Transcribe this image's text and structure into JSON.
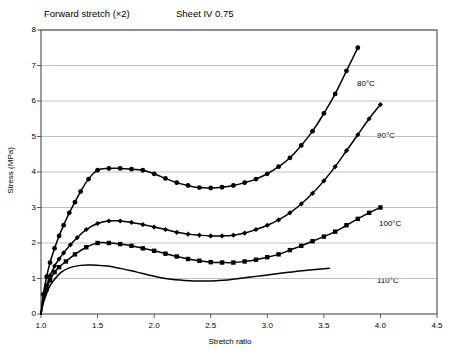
{
  "titles": {
    "forward": "Forward stretch (×2)",
    "sheet": "Sheet IV 0.75"
  },
  "axes": {
    "x_label": "Stretch ratio",
    "y_label": "Stress (MPa)"
  },
  "series_labels": {
    "c80": "80°C",
    "c90": "90°C",
    "c100": "100°C",
    "c110": "110°C"
  },
  "chart_data": {
    "type": "line",
    "subtitle": "Sheet IV 0.75",
    "xlabel": "Stretch ratio",
    "ylabel": "Stress (MPa)",
    "xlim": [
      1.0,
      4.5
    ],
    "ylim": [
      0,
      8
    ],
    "xticks": [
      1.0,
      1.5,
      2.0,
      2.5,
      3.0,
      3.5,
      4.0,
      4.5
    ],
    "xtick_labels": [
      "1.0",
      "1.5",
      "2.0",
      "2.5",
      "3.0",
      "3.5",
      "4.0",
      "4.5"
    ],
    "yticks": [
      0,
      1,
      2,
      3,
      4,
      5,
      6,
      7,
      8
    ],
    "ytick_labels": [
      "0",
      "1",
      "2",
      "3",
      "4",
      "5",
      "6",
      "7",
      "8"
    ],
    "grid": "horizontal",
    "legend": "inline-annotations",
    "line_color": "#000000",
    "series": [
      {
        "name": "80°C",
        "marker": "circle",
        "x": [
          1.0,
          1.02,
          1.05,
          1.08,
          1.12,
          1.16,
          1.2,
          1.25,
          1.3,
          1.35,
          1.42,
          1.5,
          1.6,
          1.7,
          1.8,
          1.9,
          2.0,
          2.1,
          2.2,
          2.3,
          2.4,
          2.5,
          2.6,
          2.7,
          2.8,
          2.9,
          3.0,
          3.1,
          3.2,
          3.3,
          3.4,
          3.5,
          3.6,
          3.7,
          3.8
        ],
        "y": [
          0.0,
          0.55,
          1.05,
          1.45,
          1.85,
          2.2,
          2.5,
          2.85,
          3.15,
          3.45,
          3.8,
          4.05,
          4.1,
          4.1,
          4.08,
          4.05,
          3.95,
          3.82,
          3.7,
          3.62,
          3.56,
          3.55,
          3.57,
          3.62,
          3.7,
          3.8,
          3.95,
          4.15,
          4.4,
          4.75,
          5.15,
          5.65,
          6.2,
          6.85,
          7.5
        ]
      },
      {
        "name": "90°C",
        "marker": "diamond",
        "x": [
          1.0,
          1.02,
          1.05,
          1.08,
          1.12,
          1.16,
          1.2,
          1.26,
          1.32,
          1.4,
          1.5,
          1.6,
          1.7,
          1.8,
          1.9,
          2.0,
          2.1,
          2.2,
          2.3,
          2.4,
          2.5,
          2.6,
          2.7,
          2.8,
          2.9,
          3.0,
          3.1,
          3.2,
          3.3,
          3.4,
          3.5,
          3.6,
          3.7,
          3.8,
          3.9,
          4.0
        ],
        "y": [
          0.0,
          0.42,
          0.8,
          1.08,
          1.35,
          1.55,
          1.72,
          1.95,
          2.15,
          2.38,
          2.55,
          2.62,
          2.62,
          2.58,
          2.52,
          2.45,
          2.38,
          2.3,
          2.25,
          2.22,
          2.2,
          2.2,
          2.22,
          2.28,
          2.38,
          2.5,
          2.65,
          2.85,
          3.1,
          3.4,
          3.75,
          4.15,
          4.6,
          5.05,
          5.5,
          5.9
        ]
      },
      {
        "name": "100°C",
        "marker": "square",
        "x": [
          1.0,
          1.02,
          1.05,
          1.08,
          1.12,
          1.16,
          1.22,
          1.3,
          1.4,
          1.5,
          1.6,
          1.7,
          1.8,
          1.9,
          2.0,
          2.1,
          2.2,
          2.3,
          2.4,
          2.5,
          2.6,
          2.7,
          2.8,
          2.9,
          3.0,
          3.1,
          3.2,
          3.3,
          3.4,
          3.5,
          3.6,
          3.7,
          3.8,
          3.9,
          4.0
        ],
        "y": [
          0.0,
          0.38,
          0.7,
          0.95,
          1.18,
          1.32,
          1.48,
          1.68,
          1.88,
          2.0,
          2.0,
          1.97,
          1.92,
          1.85,
          1.78,
          1.7,
          1.62,
          1.55,
          1.5,
          1.46,
          1.45,
          1.45,
          1.48,
          1.53,
          1.6,
          1.68,
          1.8,
          1.92,
          2.05,
          2.18,
          2.32,
          2.5,
          2.68,
          2.85,
          3.0
        ]
      },
      {
        "name": "110°C",
        "marker": "none",
        "x": [
          1.0,
          1.02,
          1.05,
          1.08,
          1.12,
          1.18,
          1.25,
          1.35,
          1.45,
          1.55,
          1.65,
          1.75,
          1.85,
          1.95,
          2.05,
          2.15,
          2.25,
          2.35,
          2.45,
          2.55,
          2.65,
          2.75,
          2.85,
          2.95,
          3.05,
          3.15,
          3.25,
          3.35,
          3.45,
          3.55
        ],
        "y": [
          0.0,
          0.3,
          0.58,
          0.8,
          0.98,
          1.18,
          1.3,
          1.37,
          1.38,
          1.36,
          1.32,
          1.25,
          1.18,
          1.1,
          1.03,
          0.98,
          0.95,
          0.93,
          0.93,
          0.94,
          0.96,
          1.0,
          1.04,
          1.08,
          1.12,
          1.16,
          1.2,
          1.23,
          1.26,
          1.29
        ]
      }
    ]
  }
}
